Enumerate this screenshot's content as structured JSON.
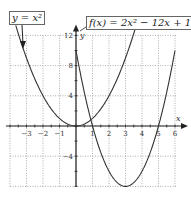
{
  "chart_data": {
    "type": "line",
    "title": "",
    "xlabel": "x",
    "ylabel": "y",
    "xlim": [
      -4,
      6
    ],
    "ylim": [
      -8,
      12
    ],
    "grid": true,
    "x_ticks": [
      "-3",
      "-2",
      "-1",
      "1",
      "2",
      "3",
      "4",
      "5",
      "6"
    ],
    "y_ticks": [
      "12",
      "8",
      "4",
      "-4"
    ],
    "series": [
      {
        "name": "y = x^2",
        "label": "y = x²",
        "formula": "x^2",
        "x": [
          -3,
          -2,
          -1,
          0,
          1,
          2,
          3
        ],
        "values": [
          9,
          4,
          1,
          0,
          1,
          4,
          9
        ]
      },
      {
        "name": "f(x) = 2x^2 - 12x + 10",
        "label": "f(x) = 2x² − 12x + 10",
        "formula": "2x^2-12x+10",
        "x": [
          0,
          1,
          2,
          3,
          4,
          5,
          6
        ],
        "values": [
          10,
          0,
          -6,
          -8,
          -6,
          0,
          10
        ]
      }
    ],
    "annotations": [
      "y = x²",
      "f(x) = 2x² − 12x + 10"
    ]
  },
  "labels": {
    "left": "y = x²",
    "right": "f(x) = 2x² − 12x + 10"
  },
  "colors": {
    "curve": "#333333",
    "grid": "#999999",
    "axis": "#222222"
  }
}
